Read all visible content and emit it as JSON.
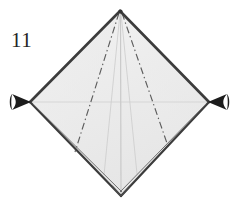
{
  "figure": {
    "number_label": "11",
    "caption": "",
    "type": "origami-fold-diagram",
    "background_color": "#ffffff"
  },
  "colors": {
    "paper_fill": "#ececec",
    "paper_fill_light": "#f4f4f4",
    "edge_stroke": "#3a3a3a",
    "crease_stroke": "#555555",
    "faint_crease_stroke": "#d2d2d2",
    "arrow_fill": "#1c1c1c",
    "label_color": "#242424"
  },
  "geometry": {
    "canvas": {
      "width": 245,
      "height": 209
    },
    "diamond": {
      "top": {
        "x": 120,
        "y": 11
      },
      "left": {
        "x": 30,
        "y": 102
      },
      "right": {
        "x": 209,
        "y": 102
      },
      "bottom": {
        "x": 121,
        "y": 196
      }
    }
  },
  "shapes": {
    "outline_name": "diamond-paper-outline",
    "creases": [
      {
        "name": "crease-left-diagonal",
        "style": "dash-dot",
        "from": "apex",
        "to": "lower-left"
      },
      {
        "name": "crease-right-diagonal",
        "style": "dash-dot",
        "from": "apex",
        "to": "lower-right"
      },
      {
        "name": "crease-center-vertical",
        "style": "faint-solid",
        "from": "apex",
        "to": "bottom"
      },
      {
        "name": "crease-horizontal-midline",
        "style": "faint-solid",
        "from": "left",
        "to": "right"
      }
    ],
    "layer_edges": [
      {
        "name": "layer-edge-bottom-left",
        "style": "double-solid"
      },
      {
        "name": "layer-edge-bottom-right",
        "style": "double-solid"
      }
    ]
  },
  "annotations": {
    "arrows": [
      {
        "name": "push-arrow-left",
        "direction": "right",
        "meaning": "push inward",
        "tip": {
          "x": 31,
          "y": 102
        },
        "tail": {
          "x": 9,
          "y": 102
        }
      },
      {
        "name": "push-arrow-right",
        "direction": "left",
        "meaning": "push inward",
        "tip": {
          "x": 208,
          "y": 102
        },
        "tail": {
          "x": 233,
          "y": 102
        }
      }
    ]
  }
}
